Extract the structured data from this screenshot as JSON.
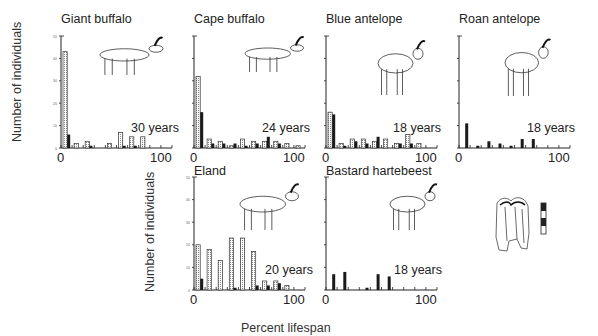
{
  "chart_data": [
    {
      "type": "bar",
      "title": "Giant buffalo",
      "annotation": "30 years",
      "xlabel": "Percent lifespan",
      "ylabel": "Number of individuals",
      "xlim": [
        0,
        100
      ],
      "ylim": [
        0,
        50
      ],
      "yticks": [
        0,
        10,
        20,
        30,
        40,
        50
      ],
      "xticks": [
        0,
        100
      ],
      "categories": [
        0,
        10,
        20,
        30,
        40,
        50,
        60,
        70,
        80,
        90
      ],
      "series": [
        {
          "name": "hatched",
          "values": [
            43,
            2,
            3,
            0,
            2,
            7,
            5,
            5,
            0,
            0
          ]
        },
        {
          "name": "solid",
          "values": [
            6,
            0,
            1,
            0,
            0,
            1,
            1,
            0,
            0,
            0
          ]
        }
      ]
    },
    {
      "type": "bar",
      "title": "Cape buffalo",
      "annotation": "24 years",
      "xlim": [
        0,
        100
      ],
      "ylim": [
        0,
        50
      ],
      "categories": [
        0,
        10,
        20,
        30,
        40,
        50,
        60,
        70,
        80,
        90
      ],
      "series": [
        {
          "name": "hatched",
          "values": [
            32,
            4,
            3,
            1,
            4,
            3,
            3,
            3,
            2,
            1
          ]
        },
        {
          "name": "solid",
          "values": [
            16,
            2,
            2,
            2,
            1,
            2,
            5,
            2,
            0,
            0
          ]
        }
      ]
    },
    {
      "type": "bar",
      "title": "Blue antelope",
      "annotation": "18 years",
      "xlim": [
        0,
        100
      ],
      "ylim": [
        0,
        50
      ],
      "categories": [
        0,
        10,
        20,
        30,
        40,
        50,
        60,
        70,
        80,
        90
      ],
      "series": [
        {
          "name": "hatched",
          "values": [
            16,
            2,
            4,
            4,
            3,
            4,
            2,
            6,
            2,
            0
          ]
        },
        {
          "name": "solid",
          "values": [
            15,
            1,
            3,
            2,
            5,
            0,
            2,
            2,
            0,
            0
          ]
        }
      ]
    },
    {
      "type": "bar",
      "title": "Roan antelope",
      "annotation": "18 years",
      "xlim": [
        0,
        100
      ],
      "ylim": [
        0,
        50
      ],
      "categories": [
        0,
        10,
        20,
        30,
        40,
        50,
        60,
        70,
        80,
        90
      ],
      "series": [
        {
          "name": "hatched",
          "values": [
            0,
            0,
            0,
            0,
            0,
            0,
            0,
            0,
            0,
            0
          ]
        },
        {
          "name": "solid",
          "values": [
            11,
            1,
            3,
            2,
            1,
            4,
            4,
            0,
            0,
            0
          ]
        }
      ]
    },
    {
      "type": "bar",
      "title": "Eland",
      "annotation": "20 years",
      "xlim": [
        0,
        100
      ],
      "ylim": [
        0,
        50
      ],
      "yticks": [
        0,
        10,
        20,
        30,
        40,
        50
      ],
      "categories": [
        0,
        10,
        20,
        30,
        40,
        50,
        60,
        70,
        80,
        90
      ],
      "series": [
        {
          "name": "hatched",
          "values": [
            20,
            18,
            13,
            23,
            23,
            17,
            4,
            4,
            2,
            0
          ]
        },
        {
          "name": "solid",
          "values": [
            5,
            0,
            0,
            1,
            0,
            2,
            2,
            3,
            0,
            0
          ]
        }
      ]
    },
    {
      "type": "bar",
      "title": "Bastard hartebeest",
      "annotation": "18 years",
      "xlim": [
        0,
        100
      ],
      "ylim": [
        0,
        50
      ],
      "categories": [
        0,
        10,
        20,
        30,
        40,
        50,
        60,
        70,
        80,
        90
      ],
      "series": [
        {
          "name": "hatched",
          "values": [
            0,
            0,
            0,
            0,
            0,
            0,
            0,
            0,
            0,
            0
          ]
        },
        {
          "name": "solid",
          "values": [
            7,
            8,
            0,
            1,
            7,
            6,
            0,
            0,
            0,
            0
          ]
        }
      ]
    }
  ],
  "labels": {
    "ylabel": "Number of individuals",
    "xlabel": "Percent lifespan",
    "x0": "0",
    "x100": "100"
  },
  "colors": {
    "axis": "#222222",
    "solid_bar": "#1a1a1a",
    "hatched_fill": "#d8d8d8"
  }
}
